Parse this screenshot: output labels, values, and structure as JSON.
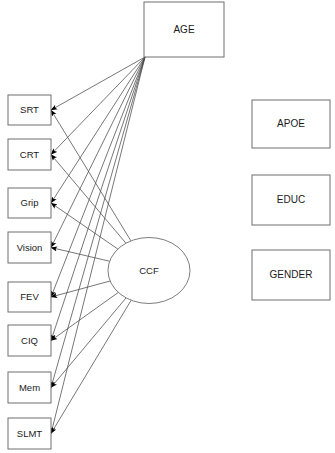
{
  "diagram": {
    "type": "path-diagram",
    "title": "",
    "canvas": {
      "width": 335,
      "height": 453,
      "background": "#ffffff"
    },
    "colors": {
      "box_stroke": "#6f6f6f",
      "ellipse_stroke": "#6f6f6f",
      "edge_stroke": "#4a4a4a",
      "arrowhead_fill": "#000000",
      "text": "#1a1a1a",
      "background": "#ffffff"
    },
    "nodes": {
      "exogenous": {
        "id": "AGE",
        "label": "AGE",
        "shape": "rectangle",
        "x": 144,
        "y": 2,
        "w": 80,
        "h": 55
      },
      "latent": {
        "id": "CCF",
        "label": "CCF",
        "shape": "ellipse",
        "cx": 149,
        "cy": 270.5,
        "rx": 41,
        "ry": 33
      },
      "indicators": [
        {
          "id": "SRT",
          "label": "SRT",
          "shape": "rectangle",
          "x": 8,
          "y": 95,
          "w": 43,
          "h": 30
        },
        {
          "id": "CRT",
          "label": "CRT",
          "shape": "rectangle",
          "x": 8,
          "y": 139,
          "w": 43,
          "h": 31
        },
        {
          "id": "Grip",
          "label": "Grip",
          "shape": "rectangle",
          "x": 8,
          "y": 188,
          "w": 43,
          "h": 30
        },
        {
          "id": "Vision",
          "label": "Vision",
          "shape": "rectangle",
          "x": 8,
          "y": 232,
          "w": 43,
          "h": 31
        },
        {
          "id": "FEV",
          "label": "FEV",
          "shape": "rectangle",
          "x": 8,
          "y": 282,
          "w": 43,
          "h": 30
        },
        {
          "id": "CIQ",
          "label": "CIQ",
          "shape": "rectangle",
          "x": 8,
          "y": 325,
          "w": 43,
          "h": 31
        },
        {
          "id": "Mem",
          "label": "Mem",
          "shape": "rectangle",
          "x": 8,
          "y": 372,
          "w": 43,
          "h": 31
        },
        {
          "id": "SLMT",
          "label": "SLMT",
          "shape": "rectangle",
          "x": 8,
          "y": 418,
          "w": 43,
          "h": 31
        }
      ],
      "unconnected": [
        {
          "id": "APOE",
          "label": "APOE",
          "shape": "rectangle",
          "x": 252,
          "y": 100,
          "w": 78,
          "h": 48
        },
        {
          "id": "EDUC",
          "label": "EDUC",
          "shape": "rectangle",
          "x": 252,
          "y": 175,
          "w": 78,
          "h": 50
        },
        {
          "id": "GENDER",
          "label": "GENDER",
          "shape": "rectangle",
          "x": 252,
          "y": 250,
          "w": 78,
          "h": 50
        }
      ]
    },
    "edges": {
      "from_age": {
        "source": "AGE",
        "origin": {
          "x": 145,
          "y": 57
        },
        "targets": [
          "SRT",
          "CRT",
          "Grip",
          "Vision",
          "FEV",
          "CIQ",
          "Mem",
          "SLMT"
        ],
        "arrowhead": "filled-triangle",
        "count": 8
      },
      "from_ccf": {
        "source": "CCF",
        "targets": [
          "SRT",
          "CRT",
          "Grip",
          "Vision",
          "FEV",
          "CIQ",
          "Mem",
          "SLMT"
        ],
        "arrowhead": "filled-triangle",
        "count": 8
      }
    }
  }
}
